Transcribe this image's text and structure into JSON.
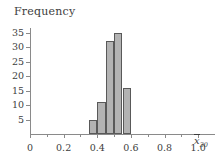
{
  "figure": {
    "y_axis_title": "Frequency",
    "x_axis_symbol": "x",
    "x_axis_subscript": "30"
  },
  "chart_data": {
    "type": "bar",
    "title": "",
    "subtitle": "",
    "xlabel": "x̄30",
    "ylabel": "Frequency",
    "grid": false,
    "legend": "none",
    "xlim": [
      0,
      1.1
    ],
    "ylim": [
      0,
      37
    ],
    "x_ticks": [
      0,
      0.2,
      0.4,
      0.6,
      0.8,
      1.0
    ],
    "x_tick_labels": [
      "0",
      "0.2",
      "0.4",
      "0.6",
      "0.8",
      "1.0"
    ],
    "x_minor_ticks": [
      0.1,
      0.3,
      0.5,
      0.7,
      0.9
    ],
    "y_ticks": [
      5,
      10,
      15,
      20,
      25,
      30,
      35
    ],
    "y_tick_labels": [
      "5",
      "10",
      "15",
      "20",
      "25",
      "30",
      "35"
    ],
    "bin_width": 0.05,
    "bins": [
      {
        "left": 0.35,
        "right": 0.4,
        "frequency": 5
      },
      {
        "left": 0.4,
        "right": 0.45,
        "frequency": 11
      },
      {
        "left": 0.45,
        "right": 0.5,
        "frequency": 32
      },
      {
        "left": 0.5,
        "right": 0.55,
        "frequency": 35
      },
      {
        "left": 0.55,
        "right": 0.6,
        "frequency": 16
      }
    ],
    "categories": [
      "0.35-0.40",
      "0.40-0.45",
      "0.45-0.50",
      "0.50-0.55",
      "0.55-0.60"
    ],
    "values": [
      5,
      11,
      32,
      35,
      16
    ],
    "bar_fill_color": "#b3b3b3",
    "bar_edge_color": "#595959",
    "axis_color": "#8a8a8a",
    "text_color": "#3d3d3d"
  }
}
